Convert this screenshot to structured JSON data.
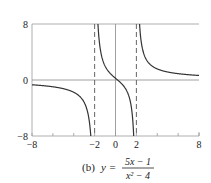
{
  "chart_data": {
    "type": "line",
    "caption": {
      "label": "(b)",
      "lhs": "y =",
      "numerator": "5x − 1",
      "denominator": "x² − 4"
    },
    "function": "y = (5x - 1)/(x^2 - 4)",
    "xlabel": "",
    "ylabel": "",
    "xlim": [
      -8,
      8
    ],
    "ylim": [
      -8,
      8
    ],
    "x_ticks": [
      -8,
      -6,
      -4,
      -2,
      0,
      2,
      4,
      6,
      8
    ],
    "x_tick_labels": [
      "-8",
      "-2",
      "0",
      "2",
      "8"
    ],
    "x_tick_label_values": [
      -8,
      -2,
      0,
      2,
      8
    ],
    "y_tick_labels": [
      "8",
      "0",
      "-8"
    ],
    "y_tick_label_values": [
      8,
      0,
      -8
    ],
    "vertical_asymptotes": [
      -2,
      2
    ],
    "horizontal_asymptote": 0,
    "grid": false,
    "series": [
      {
        "name": "y = (5x-1)/(x^2-4)",
        "branches": [
          {
            "x": [
              -8,
              -6,
              -4,
              -3,
              -2.5,
              -2.3,
              -2.2
            ],
            "y": [
              -0.68,
              -0.97,
              -1.75,
              -3.2,
              -6.22,
              -9.3,
              -14.3
            ]
          },
          {
            "x": [
              -1.7,
              -1.5,
              -1,
              -0.5,
              0,
              0.2,
              0.5,
              1,
              1.5,
              1.8
            ],
            "y": [
              12.3,
              4.86,
              2.0,
              0.93,
              0.25,
              0.0,
              -0.4,
              -1.33,
              -3.71,
              -10.5
            ]
          },
          {
            "x": [
              2.2,
              2.5,
              3,
              4,
              6,
              8
            ],
            "y": [
              11.9,
              5.11,
              2.8,
              1.58,
              0.91,
              0.65
            ]
          }
        ]
      }
    ]
  },
  "style": {
    "curve_color": "#333333",
    "axis_color": "#888888",
    "asymptote_color": "#555555",
    "frame_color": "#999999"
  }
}
